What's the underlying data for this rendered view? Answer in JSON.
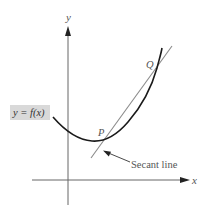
{
  "diagram": {
    "axes": {
      "x_label": "x",
      "y_label": "y"
    },
    "curve": {
      "label": "y = f(x)",
      "label_bg": "#d9d9d9",
      "color": "#1a1a1a"
    },
    "points": [
      {
        "name": "P",
        "label": "P"
      },
      {
        "name": "Q",
        "label": "Q"
      }
    ],
    "secant": {
      "label": "Secant line",
      "color": "#8a8a8a"
    },
    "colors": {
      "axis": "#444444",
      "text": "#555555"
    }
  }
}
